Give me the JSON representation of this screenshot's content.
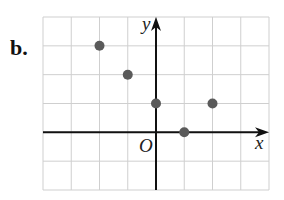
{
  "label": "b.",
  "chart_data": {
    "type": "scatter",
    "title": "",
    "xlabel": "x",
    "ylabel": "y",
    "origin_label": "O",
    "xlim": [
      -4,
      4
    ],
    "ylim": [
      -2,
      4
    ],
    "grid": true,
    "tick_labels": false,
    "points": [
      {
        "x": -2,
        "y": 3
      },
      {
        "x": -1,
        "y": 2
      },
      {
        "x": 0,
        "y": 1
      },
      {
        "x": 1,
        "y": 0
      },
      {
        "x": 2,
        "y": 1
      }
    ],
    "colors": {
      "point": "#5a5a5a",
      "grid": "#cfcfcf",
      "axis": "#111111"
    }
  }
}
